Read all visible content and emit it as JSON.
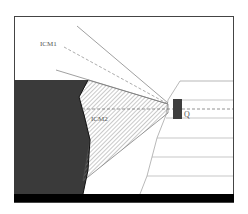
{
  "diagram": {
    "labels": {
      "upper_sector": "ICM1",
      "lower_sector": "ICM2",
      "point": "Q"
    },
    "colors": {
      "frame": "#444444",
      "dark_region": "#3a3a3a",
      "hatch_line": "#888888",
      "ray": "#777777",
      "dashed_axis": "#666666",
      "marker": "#3f3f3f",
      "base_band": "#000000",
      "step_lines": "#b0b0b0"
    }
  }
}
